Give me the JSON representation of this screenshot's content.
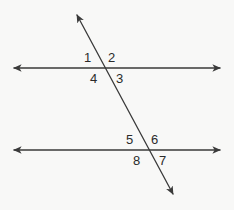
{
  "figure": {
    "background_color": "#f8f8f7",
    "stroke_color": "#3a3a3a",
    "label_color": "#2b2b2b",
    "stroke_width": 1.3
  },
  "lines": [
    {
      "id": "upper-parallel-line",
      "name": "upper parallel line",
      "kind": "double-arrow-line",
      "x1": 14,
      "y1": 68,
      "x2": 220,
      "y2": 68
    },
    {
      "id": "lower-parallel-line",
      "name": "lower parallel line",
      "kind": "double-arrow-line",
      "x1": 14,
      "y1": 150,
      "x2": 220,
      "y2": 150
    },
    {
      "id": "transversal-line",
      "name": "transversal",
      "kind": "double-arrow-line",
      "x1": 77,
      "y1": 15,
      "x2": 173,
      "y2": 194
    }
  ],
  "intersections": [
    {
      "id": "upper-intersection",
      "x": 103,
      "y": 68
    },
    {
      "id": "lower-intersection",
      "x": 147,
      "y": 150
    }
  ],
  "angle_labels": [
    {
      "id": "angle-1",
      "text": "1",
      "x": 84,
      "y": 51,
      "position": "upper-left"
    },
    {
      "id": "angle-2",
      "text": "2",
      "x": 108,
      "y": 51,
      "position": "upper-right"
    },
    {
      "id": "angle-3",
      "text": "3",
      "x": 116,
      "y": 72,
      "position": "lower-right"
    },
    {
      "id": "angle-4",
      "text": "4",
      "x": 90,
      "y": 72,
      "position": "lower-left"
    },
    {
      "id": "angle-5",
      "text": "5",
      "x": 126,
      "y": 133,
      "position": "upper-left"
    },
    {
      "id": "angle-6",
      "text": "6",
      "x": 151,
      "y": 133,
      "position": "upper-right"
    },
    {
      "id": "angle-7",
      "text": "7",
      "x": 159,
      "y": 154,
      "position": "lower-right"
    },
    {
      "id": "angle-8",
      "text": "8",
      "x": 133,
      "y": 154,
      "position": "lower-left"
    }
  ]
}
